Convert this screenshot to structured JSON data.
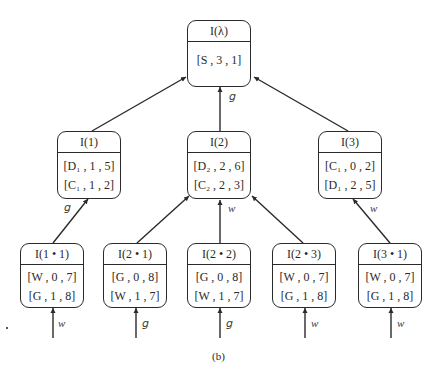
{
  "caption": "(b)",
  "nodes": {
    "root": {
      "title": "I(λ)",
      "entries": [
        "[S , 3 , 1]"
      ]
    },
    "n1": {
      "title": "I(1)",
      "entries": [
        "[D₁ , 1 , 5]",
        "[C₁ , 1 , 2]"
      ]
    },
    "n2": {
      "title": "I(2)",
      "entries": [
        "[D₂ , 2 , 6]",
        "[C₂ , 2 , 3]"
      ]
    },
    "n3": {
      "title": "I(3)",
      "entries": [
        "[C₁ , 0 , 2]",
        "[D₁ , 2 , 5]"
      ]
    },
    "n11": {
      "title": "I(1 • 1)",
      "entries": [
        "[W , 0 , 7]",
        "[G , 1 , 8]"
      ]
    },
    "n21": {
      "title": "I(2 • 1)",
      "entries": [
        "[G , 0 , 8]",
        "[W , 1 , 7]"
      ]
    },
    "n22": {
      "title": "I(2 • 2)",
      "entries": [
        "[G , 0 , 8]",
        "[W , 1 , 7]"
      ]
    },
    "n23": {
      "title": "I(2 • 3)",
      "entries": [
        "[W , 0 , 7]",
        "[G , 1 , 8]"
      ]
    },
    "n31": {
      "title": "I(3 • 1)",
      "entries": [
        "[W , 0 , 7]",
        "[G , 1 , 8]"
      ]
    }
  },
  "edge_labels": {
    "n2_to_root": "g",
    "n11_to_n1": "g",
    "n22_to_n2": "w",
    "n31_to_n3": "w",
    "in_n11": "w",
    "in_n21": "g",
    "in_n22": "g",
    "in_n23": "w",
    "in_n31": "w"
  }
}
